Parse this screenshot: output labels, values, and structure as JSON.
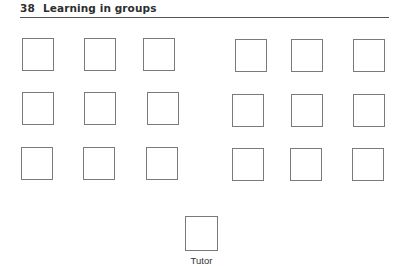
{
  "header": {
    "page_number": "38",
    "running_title": "Learning in groups"
  },
  "figure": {
    "rows": [
      {
        "row": 1,
        "seats": 6
      },
      {
        "row": 2,
        "seats": 6
      },
      {
        "row": 3,
        "seats": 6
      }
    ],
    "tutor_label": "Tutor",
    "seat_positions": [
      {
        "x": 22,
        "y": 38
      },
      {
        "x": 84,
        "y": 38
      },
      {
        "x": 143,
        "y": 38
      },
      {
        "x": 235,
        "y": 39
      },
      {
        "x": 291,
        "y": 39
      },
      {
        "x": 353,
        "y": 39
      },
      {
        "x": 22,
        "y": 92
      },
      {
        "x": 84,
        "y": 92
      },
      {
        "x": 147,
        "y": 92
      },
      {
        "x": 232,
        "y": 94
      },
      {
        "x": 291,
        "y": 94
      },
      {
        "x": 353,
        "y": 94
      },
      {
        "x": 21,
        "y": 147
      },
      {
        "x": 83,
        "y": 147
      },
      {
        "x": 146,
        "y": 147
      },
      {
        "x": 232,
        "y": 148
      },
      {
        "x": 290,
        "y": 148
      },
      {
        "x": 352,
        "y": 148
      }
    ],
    "tutor_position": {
      "x": 185,
      "y": 216
    }
  }
}
